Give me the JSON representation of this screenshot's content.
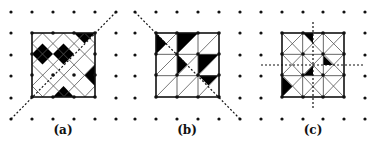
{
  "figure": {
    "width": 376,
    "height": 143,
    "colors": {
      "background": "#ffffff",
      "ink": "#111111",
      "thin_line": "#555555",
      "fill": "#000000"
    },
    "dot_rows_y": [
      12,
      33,
      55,
      76,
      98,
      119
    ],
    "panels": [
      {
        "id": "a",
        "label": "(a)",
        "label_x": 63,
        "dot_cols_x": [
          11,
          32,
          53,
          74,
          95,
          116
        ],
        "square": {
          "x0": 32,
          "y0": 33,
          "x1": 95,
          "y1": 97
        },
        "grid_pattern": "diamond-lattice",
        "thin_lines": [
          [
            32,
            43.5,
            42.5,
            33
          ],
          [
            32,
            64.5,
            63.5,
            33
          ],
          [
            32,
            86,
            84.5,
            33
          ],
          [
            42.5,
            97,
            95,
            43.5
          ],
          [
            63.5,
            97,
            95,
            64.5
          ],
          [
            84.5,
            97,
            95,
            86
          ],
          [
            42.5,
            33,
            95,
            86
          ],
          [
            63.5,
            33,
            95,
            64.5
          ],
          [
            84.5,
            33,
            95,
            43.5
          ],
          [
            32,
            43.5,
            85.5,
            97
          ],
          [
            32,
            64.5,
            64.5,
            97
          ],
          [
            32,
            86,
            43,
            97
          ]
        ],
        "dashed_lines": [
          [
            11,
            119,
            116,
            12
          ]
        ],
        "filled_shapes": [
          [
            [
              32,
              54
            ],
            [
              42.5,
              43.5
            ],
            [
              53,
              54
            ],
            [
              42.5,
              64.5
            ]
          ],
          [
            [
              53,
              54
            ],
            [
              63.5,
              43.5
            ],
            [
              74,
              54
            ],
            [
              63.5,
              64.5
            ]
          ],
          [
            [
              74,
              33
            ],
            [
              95,
              33
            ],
            [
              84.5,
              43.5
            ]
          ],
          [
            [
              95,
              64.5
            ],
            [
              95,
              86
            ],
            [
              84.5,
              75
            ]
          ],
          [
            [
              53,
              97
            ],
            [
              74,
              97
            ],
            [
              63.5,
              86
            ]
          ]
        ],
        "inner_nodes": [
          [
            32,
            33
          ],
          [
            53,
            33
          ],
          [
            74,
            33
          ],
          [
            95,
            33
          ],
          [
            32,
            54
          ],
          [
            95,
            54
          ],
          [
            32,
            75
          ],
          [
            53,
            75
          ],
          [
            74,
            75
          ],
          [
            95,
            75
          ],
          [
            32,
            97
          ],
          [
            53,
            97
          ],
          [
            74,
            97
          ],
          [
            95,
            97
          ]
        ]
      },
      {
        "id": "b",
        "label": "(b)",
        "label_x": 187,
        "dot_cols_x": [
          135,
          156,
          177,
          198,
          219,
          240
        ],
        "square": {
          "x0": 156,
          "y0": 33,
          "x1": 219,
          "y1": 97
        },
        "grid_pattern": "slash-triangles",
        "thin_lines": [
          [
            156,
            54,
            177,
            33
          ],
          [
            156,
            75,
            198,
            33
          ],
          [
            156,
            97,
            219,
            33
          ],
          [
            177,
            97,
            219,
            54
          ],
          [
            198,
            97,
            219,
            75
          ]
        ],
        "dashed_lines": [
          [
            135,
            12,
            240,
            119
          ]
        ],
        "filled_shapes": [
          [
            [
              156,
              33
            ],
            [
              156,
              54
            ],
            [
              166.5,
              43.5
            ]
          ],
          [
            [
              177,
              33
            ],
            [
              198,
              33
            ],
            [
              177,
              54
            ]
          ],
          [
            [
              177,
              54
            ],
            [
              187.5,
              64.5
            ],
            [
              177,
              75
            ]
          ],
          [
            [
              198,
              54
            ],
            [
              219,
              54
            ],
            [
              198,
              75
            ]
          ],
          [
            [
              198,
              75
            ],
            [
              219,
              75
            ],
            [
              208.5,
              85.5
            ]
          ]
        ],
        "inner_nodes": [
          [
            156,
            33
          ],
          [
            177,
            33
          ],
          [
            198,
            33
          ],
          [
            219,
            33
          ],
          [
            156,
            54
          ],
          [
            177,
            54
          ],
          [
            198,
            54
          ],
          [
            219,
            54
          ],
          [
            156,
            75
          ],
          [
            177,
            75
          ],
          [
            198,
            75
          ],
          [
            219,
            75
          ],
          [
            156,
            97
          ],
          [
            177,
            97
          ],
          [
            198,
            97
          ],
          [
            219,
            97
          ]
        ]
      },
      {
        "id": "c",
        "label": "(c)",
        "label_x": 313,
        "dot_cols_x": [
          261,
          282,
          303,
          323,
          344,
          365
        ],
        "square": {
          "x0": 282,
          "y0": 33,
          "x1": 344,
          "y1": 97
        },
        "grid_pattern": "x-crossed-cells",
        "thin_lines": [
          [
            282,
            33,
            344,
            97
          ],
          [
            282,
            97,
            344,
            33
          ],
          [
            303,
            33,
            344,
            75
          ],
          [
            282,
            54,
            323,
            97
          ],
          [
            323,
            33,
            344,
            54
          ],
          [
            282,
            75,
            303,
            97
          ],
          [
            282,
            54,
            303,
            33
          ],
          [
            282,
            75,
            323,
            33
          ],
          [
            303,
            97,
            344,
            54
          ],
          [
            323,
            97,
            344,
            75
          ]
        ],
        "dashed_lines": [
          [
            313,
            22,
            313,
            110
          ],
          [
            261,
            65,
            365,
            65
          ]
        ],
        "filled_shapes": [
          [
            [
              303,
              33
            ],
            [
              313,
              33
            ],
            [
              313,
              43.5
            ]
          ],
          [
            [
              323,
              55
            ],
            [
              333,
              65
            ],
            [
              323,
              65
            ]
          ],
          [
            [
              303,
              76
            ],
            [
              313,
              65.5
            ],
            [
              313,
              76
            ]
          ],
          [
            [
              282,
              76
            ],
            [
              282,
              97
            ],
            [
              292.5,
              86.5
            ]
          ]
        ],
        "inner_nodes": [
          [
            282,
            33
          ],
          [
            303,
            33
          ],
          [
            323,
            33
          ],
          [
            344,
            33
          ],
          [
            282,
            54
          ],
          [
            303,
            54
          ],
          [
            323,
            54
          ],
          [
            344,
            54
          ],
          [
            282,
            75
          ],
          [
            303,
            75
          ],
          [
            323,
            75
          ],
          [
            344,
            75
          ],
          [
            282,
            97
          ],
          [
            303,
            97
          ],
          [
            323,
            97
          ],
          [
            344,
            97
          ]
        ]
      }
    ]
  }
}
